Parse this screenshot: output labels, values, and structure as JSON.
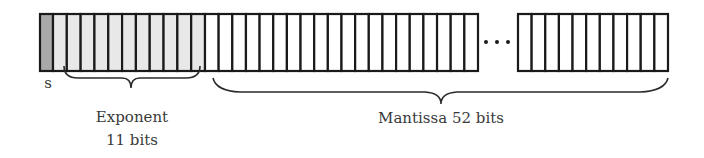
{
  "diagram": {
    "colors": {
      "sign_fill": "#a9a9a9",
      "exponent_fill": "#e8e8e8",
      "mantissa_fill": "#ffffff",
      "stroke": "#1a1a1a",
      "text": "#3a3a3a"
    },
    "fields": [
      {
        "name": "sign",
        "label": "s",
        "bits": 1
      },
      {
        "name": "exponent",
        "label": "Exponent",
        "sublabel": "11 bits",
        "bits": 11
      },
      {
        "name": "mantissa",
        "label": "Mantissa 52 bits",
        "bits": 52
      }
    ],
    "ellipsis": "•••",
    "visible_cells": {
      "left_segment_mantissa_cells": 20,
      "right_segment_mantissa_cells": 11
    }
  }
}
